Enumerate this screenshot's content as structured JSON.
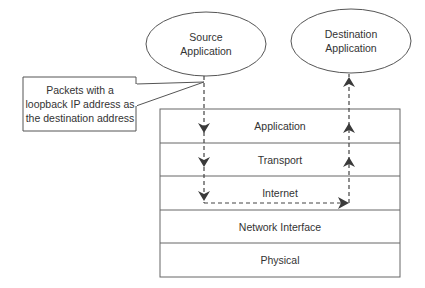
{
  "diagram": {
    "type": "network-loopback-flow",
    "colors": {
      "stroke": "#555555",
      "text": "#333333",
      "arrow": "#3a3a3a",
      "background": "#ffffff"
    },
    "source_node": {
      "line1": "Source",
      "line2": "Application"
    },
    "destination_node": {
      "line1": "Destination",
      "line2": "Application"
    },
    "callout": {
      "line1": "Packets with a",
      "line2": "loopback IP address as",
      "line3": "the destination address"
    },
    "layers": [
      {
        "label": "Application"
      },
      {
        "label": "Transport"
      },
      {
        "label": "Internet"
      },
      {
        "label": "Network Interface"
      },
      {
        "label": "Physical"
      }
    ],
    "flow": {
      "down_path": [
        "Source Application",
        "Application",
        "Transport",
        "Internet"
      ],
      "across": "Internet (loopback)",
      "up_path": [
        "Internet",
        "Transport",
        "Application",
        "Destination Application"
      ]
    }
  }
}
